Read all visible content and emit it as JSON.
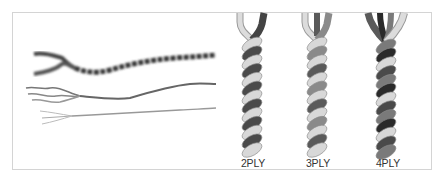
{
  "figure": {
    "ply_types": [
      {
        "label": "2PLY",
        "strands": 2,
        "colors": [
          "#d8d8d8",
          "#4a4a4a"
        ]
      },
      {
        "label": "3PLY",
        "strands": 3,
        "colors": [
          "#d8d8d8",
          "#8a8a8a",
          "#5a5a5a"
        ]
      },
      {
        "label": "4PLY",
        "strands": 4,
        "colors": [
          "#d8d8d8",
          "#7a7a7a",
          "#4a4a4a",
          "#2a2a2a"
        ]
      }
    ]
  }
}
